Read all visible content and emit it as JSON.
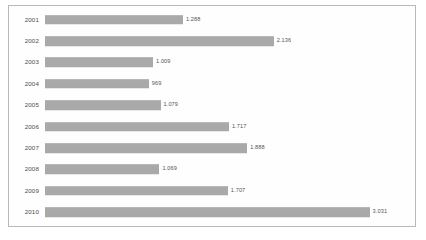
{
  "chart_data": {
    "type": "bar",
    "orientation": "horizontal",
    "title": "",
    "subtitle": "",
    "xlabel": "",
    "ylabel": "",
    "grid": false,
    "legend": false,
    "legend_position": "none",
    "xlim": [
      0,
      3100
    ],
    "categories": [
      "2001",
      "2002",
      "2003",
      "2004",
      "2005",
      "2006",
      "2007",
      "2008",
      "2009",
      "2010"
    ],
    "values": [
      1288,
      2136,
      1009,
      969,
      1079,
      1717,
      1888,
      1069,
      1707,
      3031
    ],
    "value_labels": [
      "1.288",
      "2.136",
      "1.009",
      "969",
      "1.079",
      "1.717",
      "1.888",
      "1.069",
      "1.707",
      "3.031"
    ],
    "bar_color": "#a9a9a9",
    "frame_color": "#b9b9b9",
    "background_color": "#ffffff",
    "label_color": "#4b4b4b"
  }
}
